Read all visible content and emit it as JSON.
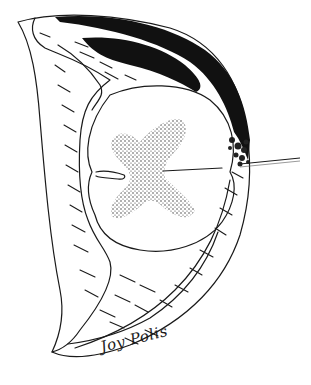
{
  "illustration": {
    "subject": "spinal cord cross-section with surrounding sheath and dark lesion region",
    "signature": "Joy Polis",
    "colors": {
      "ink": "#1a1a1a",
      "dark_region": "#111111",
      "background": "#ffffff"
    },
    "regions": [
      {
        "name": "outer-crescent-sheath",
        "fill": "hatched"
      },
      {
        "name": "dark-band-upper-right",
        "fill": "solid black"
      },
      {
        "name": "spinal-cord-white-matter",
        "fill": "white"
      },
      {
        "name": "gray-matter-butterfly",
        "fill": "stippled"
      },
      {
        "name": "probe-needle",
        "fill": "line"
      }
    ]
  }
}
